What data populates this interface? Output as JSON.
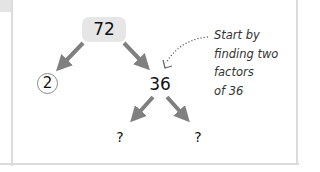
{
  "diagram": {
    "type": "factor-tree",
    "root": "72",
    "left_child": "2",
    "left_child_style": "circled (prime)",
    "right_child": "36",
    "grandchildren": [
      "?",
      "?"
    ],
    "annotation": {
      "lines": [
        "Start by",
        "finding two",
        "factors",
        "of 36"
      ]
    },
    "colors": {
      "arrow": "#808080",
      "root_box": "#e6e6e6",
      "border": "#dcdcdc",
      "text": "#111111"
    }
  }
}
